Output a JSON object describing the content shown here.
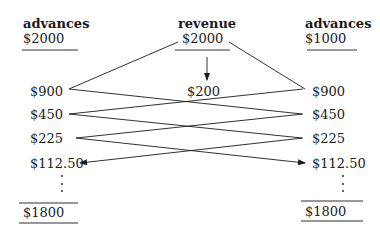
{
  "diagram": {
    "left_column": {
      "header": "advances",
      "initial": "$2000",
      "values": [
        "$900",
        "$450",
        "$225",
        "$112.50"
      ],
      "ellipsis": ":",
      "total": "$1800"
    },
    "center_column": {
      "header": "revenue",
      "initial": "$2000",
      "retained": "$200"
    },
    "right_column": {
      "header": "advances",
      "initial": "$1000",
      "values": [
        "$900",
        "$450",
        "$225",
        "$112.50"
      ],
      "ellipsis": ":",
      "total": "$1800"
    },
    "line_color": "#1a1a1a"
  }
}
